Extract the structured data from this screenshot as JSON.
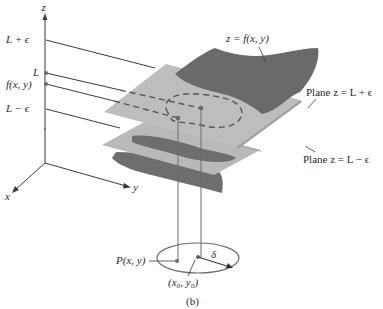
{
  "figure": {
    "caption": "(b)",
    "axes": {
      "z_label": "z",
      "x_label": "x",
      "y_label": "y"
    },
    "z_axis_ticks": [
      {
        "label": "L + ϵ",
        "value": "L+epsilon"
      },
      {
        "label": "L",
        "value": "L"
      },
      {
        "label": "f(x, y)",
        "value": "f(x,y)"
      },
      {
        "label": "L − ϵ",
        "value": "L-epsilon"
      }
    ],
    "annotations": {
      "surface": "z = f(x, y)",
      "upper_plane": "Plane z = L + ϵ",
      "lower_plane": "Plane z = L − ϵ",
      "point_p": "P(x, y)",
      "center": "(x₀, y₀)",
      "radius": "δ"
    },
    "colors": {
      "plane": "#b4b4b4",
      "surface": "#6e6e6e",
      "lines": "#3a3a3a",
      "background": "#ffffff"
    }
  }
}
